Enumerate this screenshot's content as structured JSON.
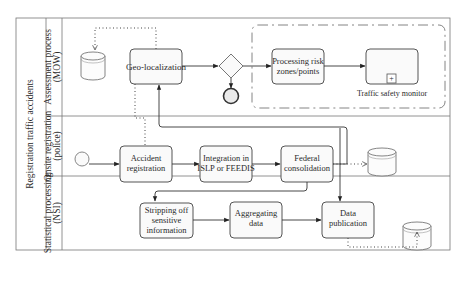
{
  "pool": {
    "title": "Registration traffic accidents"
  },
  "lanes": [
    {
      "id": "assessment",
      "line1": "Assessment process",
      "line2": "(MOW)"
    },
    {
      "id": "onsite",
      "line1": "Onsite registration",
      "line2": "(police)"
    },
    {
      "id": "statistical",
      "line1": "Statistical processing",
      "line2": "(NSI)"
    }
  ],
  "tasks": {
    "geo": {
      "lines": [
        "Geo-localization"
      ]
    },
    "risk": {
      "lines": [
        "Processing risk",
        "zones/points"
      ]
    },
    "monitor": {
      "label": "Traffic safety monitor",
      "marker": "+"
    },
    "accident": {
      "lines": [
        "Accident",
        "registration"
      ]
    },
    "integration": {
      "lines": [
        "Integration in",
        "ISLP or FEEDIS"
      ]
    },
    "federal": {
      "lines": [
        "Federal",
        "consolidation"
      ]
    },
    "stripping": {
      "lines": [
        "Stripping off",
        "sensitive",
        "information"
      ]
    },
    "aggregating": {
      "lines": [
        "Aggregating",
        "data"
      ]
    },
    "publication": {
      "lines": [
        "Data",
        "publication"
      ]
    }
  },
  "colors": {
    "stroke": "#555555",
    "box_fill": "#fafafa",
    "background": "#ffffff"
  }
}
